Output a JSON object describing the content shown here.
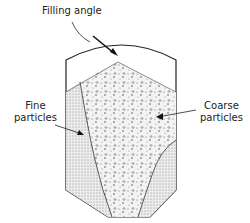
{
  "diagram": {
    "labels": {
      "filling_angle": "Filling angle",
      "fine_line1": "Fine",
      "fine_line2": "particles",
      "coarse_line1": "Coarse",
      "coarse_line2": "particles"
    },
    "colors": {
      "outline": "#222222",
      "fill": "#e4e4e4",
      "background": "#ffffff"
    }
  }
}
